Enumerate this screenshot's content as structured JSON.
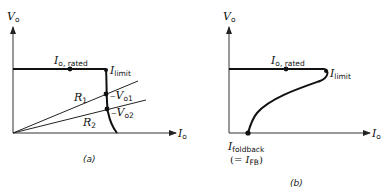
{
  "panels": [
    {
      "caption": "(a)",
      "y_axis": {
        "sym": "V",
        "sub": "o"
      },
      "x_axis": {
        "sym": "I",
        "sub": "o"
      },
      "labels": {
        "rated": {
          "sym": "I",
          "sub": "o, rated"
        },
        "limit": {
          "sym": "I",
          "sub": "limit"
        },
        "r1": {
          "sym": "R",
          "sub": "1"
        },
        "r2": {
          "sym": "R",
          "sub": "2"
        },
        "vo1": {
          "prefix": "–",
          "sym": "V",
          "sub": "o1"
        },
        "vo2": {
          "prefix": "–",
          "sym": "V",
          "sub": "o2"
        }
      }
    },
    {
      "caption": "(b)",
      "y_axis": {
        "sym": "V",
        "sub": "o"
      },
      "x_axis": {
        "sym": "I",
        "sub": "o"
      },
      "labels": {
        "rated": {
          "sym": "I",
          "sub": "o, rated"
        },
        "limit": {
          "sym": "I",
          "sub": "limit"
        },
        "foldback": {
          "sym": "I",
          "sub": "foldback"
        },
        "foldback_eq": {
          "open": "(= ",
          "sym": "I",
          "sub": "FB",
          "close": ")"
        }
      }
    }
  ]
}
